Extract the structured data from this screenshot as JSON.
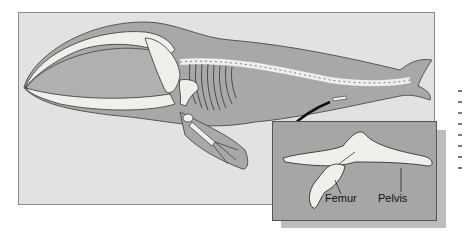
{
  "figure": {
    "colors": {
      "panel_background": "#e2e2e2",
      "body_fill": "#a8a8a8",
      "bone_fill": "#f0f0ea",
      "inset_background": "#a6a6a6",
      "inset_shadow": "#bdbdbd",
      "outline": "#333333"
    },
    "inset": {
      "labels": {
        "femur": "Femur",
        "pelvis": "Pelvis"
      }
    }
  }
}
